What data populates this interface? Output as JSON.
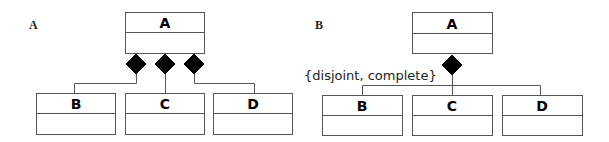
{
  "diagram": {
    "type": "uml-composition",
    "panels": [
      {
        "id": "A",
        "label": "A",
        "parent": {
          "name": "A"
        },
        "children": [
          {
            "name": "B"
          },
          {
            "name": "C"
          },
          {
            "name": "D"
          }
        ],
        "composition_style": "separate-diamonds",
        "constraint": null
      },
      {
        "id": "B",
        "label": "B",
        "parent": {
          "name": "A"
        },
        "children": [
          {
            "name": "B"
          },
          {
            "name": "C"
          },
          {
            "name": "D"
          }
        ],
        "composition_style": "shared-diamond",
        "constraint": "{disjoint, complete}"
      }
    ],
    "colors": {
      "line": "#555555",
      "diamond": "#000000",
      "text": "#000000"
    }
  }
}
